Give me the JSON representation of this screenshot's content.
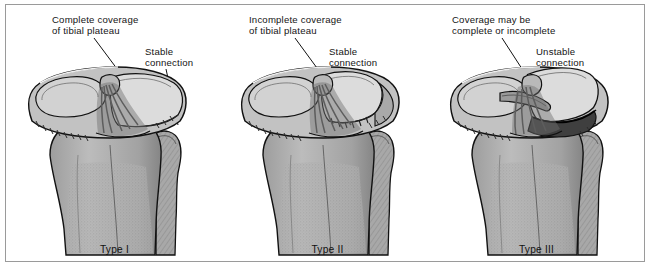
{
  "figure": {
    "title_present": false,
    "panel_count": 3,
    "frame_color": "#9a9a9a",
    "background": "#ffffff",
    "ink_color": "#141414"
  },
  "panels": [
    {
      "id": "type-1",
      "caption": "Type I",
      "labels": [
        {
          "name": "coverage-label",
          "text": "Complete coverage\nof tibial plateau"
        },
        {
          "name": "connection-label",
          "text": "Stable\nconnection"
        }
      ],
      "anatomy": {
        "view": "anterior proximal tibia",
        "parts": [
          "tibial plateau",
          "medial plateau",
          "lateral plateau",
          "anterior cruciate ligament",
          "intercondylar eminence",
          "tibial shaft",
          "fibular head",
          "fibula"
        ],
        "fracture": "fragment fully covers tibial plateau, connection intact"
      }
    },
    {
      "id": "type-2",
      "caption": "Type II",
      "labels": [
        {
          "name": "coverage-label",
          "text": "Incomplete coverage\nof tibial plateau"
        },
        {
          "name": "connection-label",
          "text": "Stable\nconnection"
        }
      ],
      "anatomy": {
        "view": "anterior proximal tibia",
        "parts": [
          "tibial plateau",
          "medial plateau",
          "lateral plateau",
          "anterior cruciate ligament",
          "intercondylar eminence",
          "tibial shaft",
          "fibular head",
          "fibula"
        ],
        "fracture": "fragment partially covers tibial plateau, connection intact"
      }
    },
    {
      "id": "type-3",
      "caption": "Type III",
      "labels": [
        {
          "name": "coverage-label",
          "text": "Coverage may be\ncomplete or incomplete"
        },
        {
          "name": "connection-label",
          "text": "Unstable\nconnection"
        }
      ],
      "anatomy": {
        "view": "anterior proximal tibia",
        "parts": [
          "tibial plateau",
          "medial plateau",
          "lateral plateau",
          "anterior cruciate ligament",
          "intercondylar eminence",
          "tibial shaft",
          "fibular head",
          "fibula"
        ],
        "fracture": "fragment displaced and detached, connection unstable"
      }
    }
  ],
  "palette": {
    "outline": "#111111",
    "bone_light": "#d2d2d2",
    "bone_mid": "#b4b4b4",
    "bone_dark": "#8e8e8e",
    "bone_deep": "#6f6f6f",
    "fragment_light": "#dcdcdc",
    "ligament": "#5d5d5d"
  }
}
